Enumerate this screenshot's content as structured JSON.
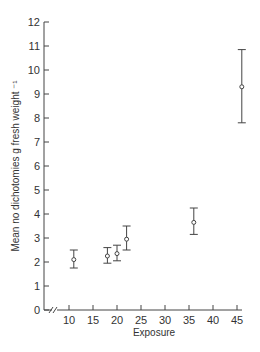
{
  "chart_data": {
    "type": "scatter",
    "title": "",
    "xlabel": "Exposure",
    "ylabel": "Mean no dichotomies  g fresh weight ⁻¹",
    "xlim": [
      5,
      46
    ],
    "ylim": [
      0,
      12
    ],
    "x_axis_break": true,
    "grid": false,
    "legend": null,
    "x_ticks": [
      10,
      15,
      20,
      25,
      30,
      35,
      40,
      45
    ],
    "y_ticks": [
      0,
      1,
      2,
      3,
      4,
      5,
      6,
      7,
      8,
      9,
      10,
      11,
      12
    ],
    "series": [
      {
        "name": "Mean dichotomies",
        "marker": "open-circle",
        "points": [
          {
            "x": 11,
            "y": 2.1,
            "err_low": 1.75,
            "err_high": 2.5
          },
          {
            "x": 18,
            "y": 2.25,
            "err_low": 1.95,
            "err_high": 2.6
          },
          {
            "x": 20,
            "y": 2.35,
            "err_low": 2.05,
            "err_high": 2.7
          },
          {
            "x": 22,
            "y": 2.95,
            "err_low": 2.5,
            "err_high": 3.5
          },
          {
            "x": 36,
            "y": 3.65,
            "err_low": 3.15,
            "err_high": 4.25
          },
          {
            "x": 46,
            "y": 9.3,
            "err_low": 7.8,
            "err_high": 10.85
          }
        ]
      }
    ]
  },
  "labels": {
    "xlabel": "Exposure",
    "ylabel": "Mean no dichotomies  g fresh weight ⁻¹"
  },
  "colors": {
    "axis": "#444444",
    "marker": "#444444"
  }
}
